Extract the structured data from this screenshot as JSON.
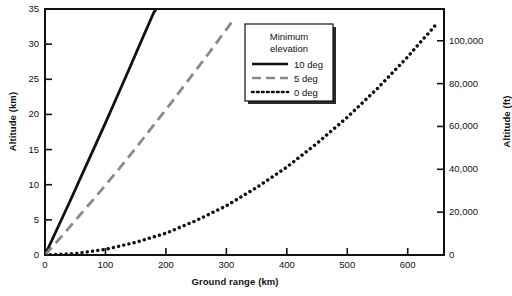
{
  "chart_data": {
    "type": "line",
    "title": "",
    "xlabel": "Ground range (km)",
    "ylabel": "Altitude (km)",
    "ylabel_secondary": "Altitude (ft)",
    "xlim": [
      0,
      660
    ],
    "ylim": [
      0,
      35
    ],
    "ylim_secondary": [
      0,
      114829
    ],
    "grid": false,
    "legend_position": "top-center-right",
    "legend_title_line1": "Minimum",
    "legend_title_line2": "elevation",
    "xticks": [
      0,
      100,
      200,
      300,
      400,
      500,
      600
    ],
    "xticklabels": [
      "0",
      "100",
      "200",
      "300",
      "400",
      "500",
      "600"
    ],
    "yticks": [
      0,
      5,
      10,
      15,
      20,
      25,
      30,
      35
    ],
    "yticklabels": [
      "0",
      "5",
      "10",
      "15",
      "20",
      "25",
      "30",
      "35"
    ],
    "yticks_secondary": [
      0,
      20000,
      40000,
      60000,
      80000,
      100000
    ],
    "yticklabels_secondary": [
      "0",
      "20,000",
      "40,000",
      "60,000",
      "80,000",
      "100,000"
    ],
    "series": [
      {
        "name": "10 deg",
        "style": "solid",
        "color": "#111111",
        "x": [
          0,
          20,
          40,
          60,
          80,
          100,
          120,
          140,
          160,
          180,
          184
        ],
        "y": [
          0,
          3.7,
          7.4,
          11.2,
          15.0,
          18.8,
          22.7,
          26.6,
          30.6,
          34.5,
          35.0
        ]
      },
      {
        "name": "5 deg",
        "style": "dashed",
        "color": "#8a8a8a",
        "x": [
          0,
          30,
          60,
          90,
          120,
          150,
          180,
          210,
          240,
          270,
          300,
          312
        ],
        "y": [
          0,
          2.9,
          5.9,
          8.9,
          12.0,
          15.2,
          18.5,
          21.8,
          25.2,
          28.6,
          32.1,
          33.5
        ]
      },
      {
        "name": "0 deg",
        "style": "dotted",
        "color": "#111111",
        "x": [
          0,
          50,
          100,
          150,
          200,
          250,
          300,
          350,
          400,
          450,
          500,
          550,
          600,
          650
        ],
        "y": [
          0,
          0.2,
          0.8,
          1.8,
          3.1,
          4.9,
          7.0,
          9.6,
          12.5,
          15.9,
          19.6,
          23.7,
          28.2,
          33.1
        ]
      }
    ]
  },
  "legend": {
    "items": [
      {
        "label": "10 deg"
      },
      {
        "label": "5 deg"
      },
      {
        "label": "0 deg"
      }
    ]
  }
}
